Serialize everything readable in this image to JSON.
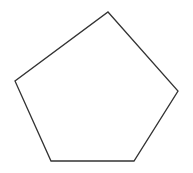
{
  "diagram": {
    "shape": "pentagon",
    "background": "#ffffff",
    "stroke_color": "#333333",
    "stroke_width": 1.3,
    "fill": "none",
    "vertices": [
      {
        "name": "top",
        "x": 108,
        "y": 12
      },
      {
        "name": "right",
        "x": 178,
        "y": 91
      },
      {
        "name": "bottom-right",
        "x": 134,
        "y": 161
      },
      {
        "name": "bottom-left",
        "x": 51,
        "y": 161
      },
      {
        "name": "left",
        "x": 15,
        "y": 81
      }
    ]
  }
}
